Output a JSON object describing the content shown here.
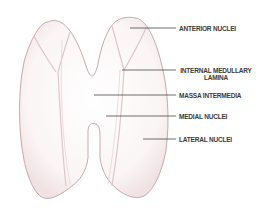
{
  "diagram": {
    "colors": {
      "background": "#ffffff",
      "lobe_fill": "#fbf6f6",
      "lobe_outline": "#c9a9ac",
      "lamina": "#dcc7c9",
      "leader_line": "#4a4a4a",
      "text": "#3a3a3a"
    },
    "labels": [
      {
        "id": "anterior-nuclei",
        "text": "ANTERIOR NUCLEI"
      },
      {
        "id": "internal-medullary-lamina",
        "line1": "INTERNAL MEDULLARY",
        "line2": "LAMINA"
      },
      {
        "id": "massa-intermedia",
        "text": "MASSA INTERMEDIA"
      },
      {
        "id": "medial-nuclei",
        "text": "MEDIAL NUCLEI"
      },
      {
        "id": "lateral-nuclei",
        "text": "LATERAL NUCLEI"
      }
    ]
  }
}
